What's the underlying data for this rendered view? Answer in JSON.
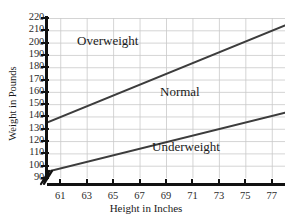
{
  "chart_data": {
    "type": "line",
    "title": "",
    "xlabel": "Height in Inches",
    "ylabel": "Weight in Pounds",
    "xlim": [
      60,
      78
    ],
    "ylim": [
      90,
      220
    ],
    "x_ticks": [
      61,
      63,
      65,
      67,
      69,
      71,
      73,
      75,
      77
    ],
    "y_ticks": [
      90,
      100,
      110,
      120,
      130,
      140,
      150,
      160,
      170,
      180,
      190,
      200,
      210,
      220
    ],
    "grid": true,
    "legend": "none",
    "y_axis_break": true,
    "series": [
      {
        "name": "Overweight threshold",
        "x": [
          60,
          78
        ],
        "values": [
          135,
          214
        ]
      },
      {
        "name": "Underweight threshold",
        "x": [
          60,
          78
        ],
        "values": [
          95,
          143
        ]
      }
    ],
    "annotations": [
      {
        "text": "Overweight",
        "x": 62.5,
        "y": 194
      },
      {
        "text": "Normal",
        "x": 69.5,
        "y": 153
      },
      {
        "text": "Underweight",
        "x": 68.5,
        "y": 108
      }
    ],
    "line_color": "#3c3c3c",
    "grid_color": "#c9c9c9",
    "axis_color": "#111111"
  },
  "axes": {
    "y_title": "Weight in Pounds",
    "x_title": "Height in Inches",
    "y_ticks": [
      "220",
      "210",
      "200",
      "190",
      "180",
      "170",
      "160",
      "150",
      "140",
      "130",
      "120",
      "110",
      "100",
      "90"
    ],
    "x_ticks": [
      "61",
      "63",
      "65",
      "67",
      "69",
      "71",
      "73",
      "75",
      "77"
    ]
  },
  "regions": {
    "overweight": "Overweight",
    "normal": "Normal",
    "underweight": "Underweight"
  }
}
